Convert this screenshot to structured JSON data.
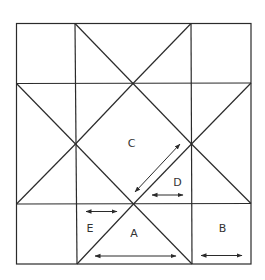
{
  "diagram": {
    "type": "quilt-block-star",
    "stroke_color": "#2b2b2b",
    "background": "#ffffff",
    "labels": {
      "A": "A",
      "B": "B",
      "C": "C",
      "D": "D",
      "E": "E"
    }
  }
}
